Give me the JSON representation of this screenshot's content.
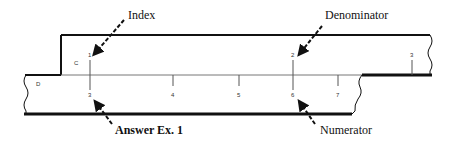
{
  "diagram": {
    "scales": {
      "c": {
        "label": "C",
        "ticks": [
          {
            "value": "1",
            "x": 90
          },
          {
            "value": "2",
            "x": 293
          },
          {
            "value": "3",
            "x": 412
          }
        ]
      },
      "d": {
        "label": "D",
        "ticks": [
          {
            "value": "3",
            "x": 90
          },
          {
            "value": "4",
            "x": 173
          },
          {
            "value": "5",
            "x": 239
          },
          {
            "value": "6",
            "x": 293
          },
          {
            "value": "7",
            "x": 338
          }
        ]
      }
    },
    "callouts": {
      "index": "Index",
      "denominator": "Denominator",
      "numerator": "Numerator",
      "answer": "Answer Ex. 1"
    },
    "colors": {
      "line": "#111111",
      "tick": "#555555"
    }
  }
}
